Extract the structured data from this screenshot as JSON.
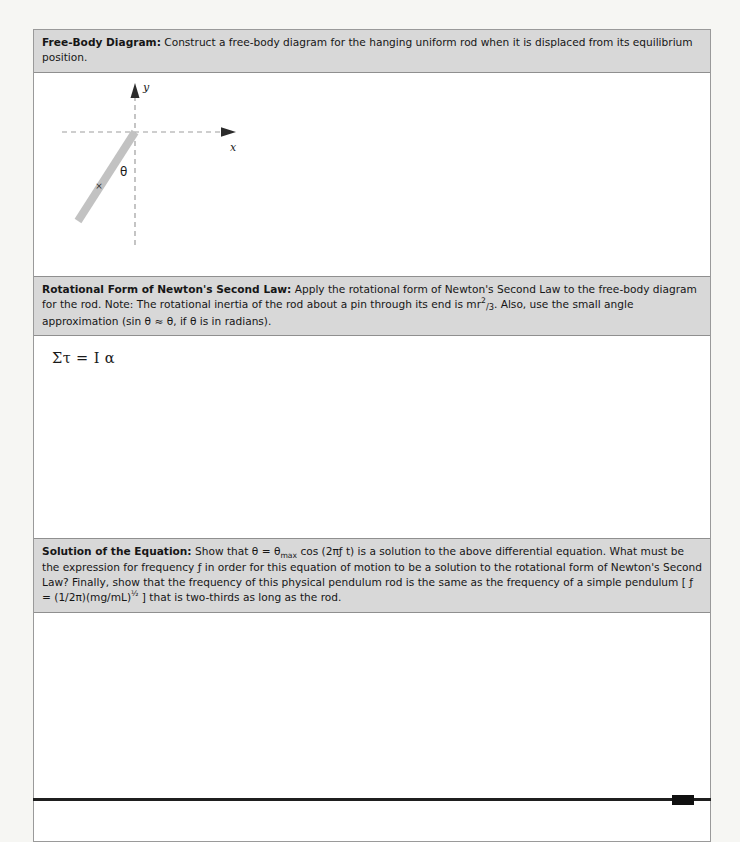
{
  "document": {
    "background_color": "#f6f6f3",
    "sheet_color": "#ffffff",
    "band_color": "#d8d8d8",
    "border_color": "#9a9a9a"
  },
  "sections": [
    {
      "id": "free-body-diagram",
      "label": "Free-Body Diagram:",
      "prompt": " Construct a free-body diagram for the hanging uniform rod when it is displaced from its equilibrium position.",
      "answer_content": "figure"
    },
    {
      "id": "rotational-second-law",
      "label": "Rotational Form of Newton's Second Law:",
      "prompt_part_1": " Apply the rotational form of Newton's Second Law to the free-body diagram for the rod. Note: The rotational inertia of the rod about a pin through its end is mr",
      "prompt_superscript": "2",
      "prompt_fraction": "/3",
      "prompt_part_2": ". Also, use the small angle approximation (sin θ ≈ θ, if θ is in radians).",
      "answer_equation": "Στ = I α"
    },
    {
      "id": "solution-of-the-equation",
      "label": "Solution of the Equation:",
      "prompt_part_1": " Show that θ = θ",
      "prompt_subscript": "max",
      "prompt_part_2": " cos (2πƒ t) is a solution to the above differential equation.  What must be the expression for frequency ƒ in order  for this equation of motion to be a solution to the rotational form of Newton's Second Law? Finally, show that the frequency of this physical pendulum rod is the same as the frequency of a simple pendulum [ ƒ = (1/2π)(mg/mL)",
      "prompt_exponent": "½",
      "prompt_part_3": " ]  that is two-thirds as long as the rod."
    }
  ],
  "figure": {
    "name": "free-body-diagram-figure",
    "y_axis_label": "y",
    "x_axis_label": "x",
    "angle_label": "θ",
    "center_of_mass_label": "×",
    "rod_color": "#c2c2c2",
    "axis_color": "#9e9e9e",
    "arrow_color": "#2b2b2b"
  }
}
